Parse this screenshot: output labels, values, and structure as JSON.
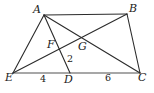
{
  "figure": {
    "type": "geometry-diagram",
    "stroke_color": "#2b2b2b",
    "base_color": "#8a8a8a",
    "background": "#ffffff",
    "points": [
      {
        "id": "A",
        "label": "A",
        "x": 44,
        "y": 15,
        "label_x": 33,
        "label_y": 4
      },
      {
        "id": "B",
        "label": "B",
        "x": 127,
        "y": 14,
        "label_x": 129,
        "label_y": 3
      },
      {
        "id": "F",
        "label": "F",
        "x": 58,
        "y": 47,
        "label_x": 47,
        "label_y": 39
      },
      {
        "id": "G",
        "label": "G",
        "x": 82,
        "y": 43,
        "label_x": 78,
        "label_y": 41
      },
      {
        "id": "E",
        "label": "E",
        "x": 13,
        "y": 73,
        "label_x": 5,
        "label_y": 72
      },
      {
        "id": "D",
        "label": "D",
        "x": 70,
        "y": 73,
        "label_x": 64,
        "label_y": 74
      },
      {
        "id": "C",
        "label": "C",
        "x": 140,
        "y": 73,
        "label_x": 138,
        "label_y": 72
      }
    ],
    "segments": [
      {
        "name": "segment-AB",
        "from": "A",
        "to": "B",
        "style": "dark"
      },
      {
        "name": "segment-AE",
        "from": "A",
        "to": "E",
        "style": "dark"
      },
      {
        "name": "segment-AD",
        "from": "A",
        "to": "D",
        "style": "dark"
      },
      {
        "name": "segment-AC",
        "from": "A",
        "to": "C",
        "style": "dark"
      },
      {
        "name": "segment-EB",
        "from": "E",
        "to": "B",
        "style": "dark"
      },
      {
        "name": "segment-BC",
        "from": "B",
        "to": "C",
        "style": "dark"
      },
      {
        "name": "segment-EC",
        "from": "E",
        "to": "C",
        "style": "base"
      }
    ],
    "measures": [
      {
        "name": "measure-ED",
        "label": "4",
        "x": 40,
        "y": 74
      },
      {
        "name": "measure-DC",
        "label": "6",
        "x": 105,
        "y": 73
      },
      {
        "name": "angle-label-2",
        "label": "2",
        "x": 67,
        "y": 54
      }
    ]
  }
}
